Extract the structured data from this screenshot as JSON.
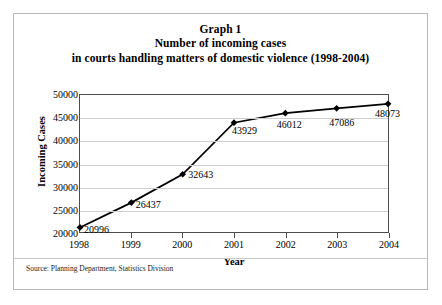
{
  "document": {
    "source_note": "Source: Planning Department, Statistics Division"
  },
  "chart_data": {
    "type": "line",
    "title": "Graph 1",
    "title_lines": [
      "Graph 1",
      "Number of incoming cases",
      "in courts handling matters of domestic violence (1998-2004)"
    ],
    "subtitle": "Number of incoming cases in courts handling matters of domestic violence (1998-2004)",
    "xlabel": "Year",
    "ylabel": "Incoming Cases",
    "categories": [
      "1998",
      "1999",
      "2000",
      "2001",
      "2002",
      "2003",
      "2004"
    ],
    "values": [
      20996,
      26437,
      32643,
      43929,
      46012,
      47086,
      48073
    ],
    "point_labels": [
      "20996",
      "26437",
      "32643",
      "43929",
      "46012",
      "47086",
      "48073"
    ],
    "ylim": [
      20000,
      50000
    ],
    "ytick_labels": [
      "50000",
      "45000",
      "40000",
      "35000",
      "30000",
      "25000",
      "20000"
    ],
    "ytick_values": [
      50000,
      45000,
      40000,
      35000,
      30000,
      25000,
      20000
    ],
    "grid": "horizontal",
    "legend": "none",
    "series_color": "#000000",
    "marker": "diamond",
    "gridline_color": "#cfcfcf",
    "frame_color": "#4d4d4d"
  }
}
